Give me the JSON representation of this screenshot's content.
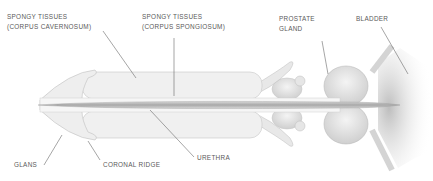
{
  "diagram": {
    "type": "anatomical-cross-section",
    "labels": {
      "corpus_cavernosum_line1": "SPONGY TISSUES",
      "corpus_cavernosum_line2": "(CORPUS CAVERNOSUM)",
      "corpus_spongiosum_line1": "SPONGY TISSUES",
      "corpus_spongiosum_line2": "(CORPUS SPONGIOSUM)",
      "prostate_line1": "PROSTATE",
      "prostate_line2": "GLAND",
      "bladder": "BLADDER",
      "glans": "GLANS",
      "coronal_ridge": "CORONAL RIDGE",
      "urethra": "URETHRA"
    },
    "colors": {
      "line": "#6a6a6a",
      "tissue": "#ededed",
      "outline": "#b8b8b8",
      "text": "#5a5a5a"
    }
  }
}
